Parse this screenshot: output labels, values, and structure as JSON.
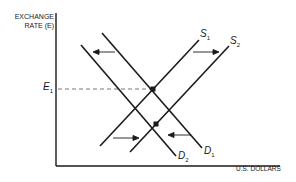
{
  "diagram": {
    "y_axis_label_line1": "EXCHANGE",
    "y_axis_label_line2": "RATE (E)",
    "x_axis_label": "U.S. DOLLARS",
    "price_marker": {
      "letter": "E",
      "sub": "1"
    },
    "curves": {
      "s1": {
        "letter": "S",
        "sub": "1"
      },
      "s2": {
        "letter": "S",
        "sub": "2"
      },
      "d1": {
        "letter": "D",
        "sub": "1"
      },
      "d2": {
        "letter": "D",
        "sub": "2"
      }
    },
    "shifts": [
      "Demand shifts left from D1 to D2",
      "Supply shifts right from S1 to S2"
    ],
    "colors": {
      "line": "#1a1a1a",
      "dashed": "#555555"
    }
  }
}
